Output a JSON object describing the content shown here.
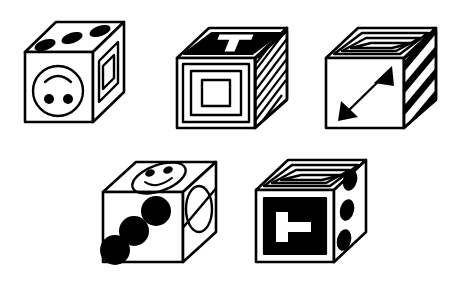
{
  "figure": {
    "title": "Five isometric cubes with patterned faces",
    "background_color": "#ffffff",
    "line_color": "#000000",
    "fill_color": "#ffffff",
    "width": 466,
    "height": 288,
    "cube_count": 5
  },
  "cubes": [
    {
      "id": "cube-1",
      "position": "top-left",
      "faces": {
        "top": {
          "symbol_name": "three-ellipses",
          "description": "three filled black ellipses in a diagonal row",
          "count": 3,
          "filled": true
        },
        "front": {
          "symbol_name": "inverted-smiley-face",
          "description": "circle outline with an upward arc above two filled dots",
          "filled": false
        },
        "right": {
          "symbol_name": "nested-diamond-outline",
          "description": "two concentric parallelogram outlines",
          "rings": 2,
          "filled": false
        }
      }
    },
    {
      "id": "cube-2",
      "position": "top-center",
      "faces": {
        "top": {
          "symbol_name": "letter-t-on-black",
          "description": "solid black face with a white letter T",
          "letter": "T",
          "filled": true
        },
        "front": {
          "symbol_name": "nested-squares",
          "description": "three concentric square outlines",
          "rings": 3,
          "filled": false
        },
        "right": {
          "symbol_name": "thin-diagonal-stripes",
          "description": "many thin diagonal stripes",
          "stripe_count": 9,
          "filled": false
        }
      }
    },
    {
      "id": "cube-3",
      "position": "top-right",
      "faces": {
        "top": {
          "symbol_name": "nested-diamond-outline",
          "description": "two concentric parallelogram outlines",
          "rings": 2,
          "filled": false
        },
        "front": {
          "symbol_name": "double-headed-diagonal-arrow",
          "description": "black double-headed arrow from lower-left to upper-right",
          "filled": true
        },
        "right": {
          "symbol_name": "bold-diagonal-stripes",
          "description": "four bold diagonal stripes",
          "stripe_count": 4,
          "filled": true
        }
      }
    },
    {
      "id": "cube-4",
      "position": "bottom-left",
      "faces": {
        "top": {
          "symbol_name": "smiley-face",
          "description": "ellipse outline with two eyes and a smile arc",
          "filled": false
        },
        "front": {
          "symbol_name": "three-circles",
          "description": "three filled black circles in a diagonal line",
          "count": 3,
          "filled": true
        },
        "right": {
          "symbol_name": "slashed-ellipse",
          "description": "ellipse outline crossed by a diagonal line",
          "filled": false
        }
      }
    },
    {
      "id": "cube-5",
      "position": "bottom-right",
      "faces": {
        "top": {
          "symbol_name": "nested-diamond-outline",
          "description": "two concentric parallelogram outlines",
          "rings": 2,
          "filled": false
        },
        "front": {
          "symbol_name": "rotated-letter-t-on-black",
          "description": "solid black square with a white letter T rotated ninety degrees",
          "letter": "T",
          "rotation_degrees": 90,
          "filled": true
        },
        "right": {
          "symbol_name": "three-ellipses",
          "description": "three filled black ellipses in a vertical line",
          "count": 3,
          "filled": true
        }
      }
    }
  ]
}
